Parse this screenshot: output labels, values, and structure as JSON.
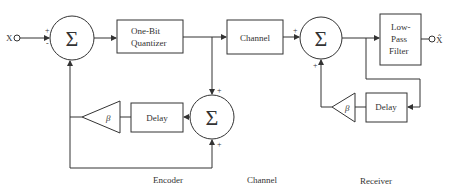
{
  "diagram": {
    "input_label": "X",
    "output_label": "X̂",
    "summer_symbol": "Σ",
    "gain_symbol": "β",
    "blocks": {
      "quantizer_line1": "One-Bit",
      "quantizer_line2": "Quantizer",
      "channel": "Channel",
      "encoder_delay": "Delay",
      "receiver_delay": "Delay",
      "lpf_line1": "Low-",
      "lpf_line2": "Pass",
      "lpf_line3": "Filter"
    },
    "signs": {
      "sum1_top": "+",
      "sum1_bottom": "-",
      "sum2_top": "+",
      "sum2_bottom": "+",
      "sum3_left": "+",
      "sum3_bottom": "+"
    },
    "sections": {
      "encoder": "Encoder",
      "channel": "Channel",
      "receiver": "Receiver"
    },
    "colors": {
      "line": "#333333",
      "background": "#ffffff"
    }
  }
}
